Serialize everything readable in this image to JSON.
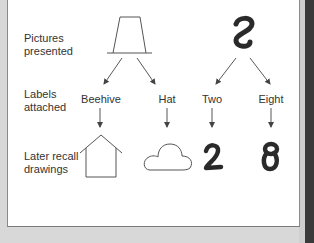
{
  "diagram": {
    "row_labels": {
      "pictures": "Pictures\npresented",
      "labels": "Labels\nattached",
      "recall": "Later recall\ndrawings"
    },
    "stimuli": [
      {
        "picture": "trapezoid-hat-figure",
        "labels": [
          {
            "text": "Beehive",
            "recall_drawing": "house-shape"
          },
          {
            "text": "Hat",
            "recall_drawing": "cloud-shape"
          }
        ]
      },
      {
        "picture": "s-shaped-figure",
        "labels": [
          {
            "text": "Two",
            "recall_drawing": "2"
          },
          {
            "text": "Eight",
            "recall_drawing": "8"
          }
        ]
      }
    ],
    "colors": {
      "line": "#555555",
      "ink": "#2a2a2a",
      "panel": "#ffffff",
      "background": "#d8d8d8"
    }
  }
}
